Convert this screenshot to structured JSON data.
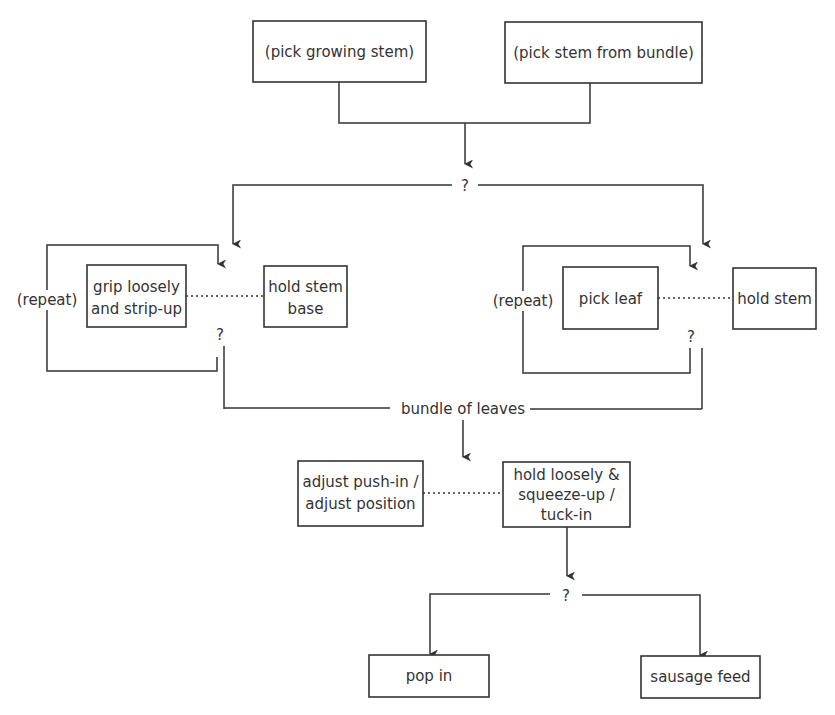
{
  "diagram": {
    "type": "flowchart",
    "start_nodes": [
      {
        "id": "pick-growing-stem",
        "label": "(pick growing stem)"
      },
      {
        "id": "pick-stem-from-bundle",
        "label": "(pick stem from bundle)"
      }
    ],
    "decision_top": {
      "label": "?"
    },
    "left_branch": {
      "repeat_label": "(repeat)",
      "action": {
        "lines": [
          "grip loosely",
          "and strip-up"
        ]
      },
      "support": {
        "lines": [
          "hold stem",
          "base"
        ]
      },
      "decision": {
        "label": "?"
      }
    },
    "right_branch": {
      "repeat_label": "(repeat)",
      "action": {
        "lines": [
          "pick leaf"
        ]
      },
      "support": {
        "lines": [
          "hold stem"
        ]
      },
      "decision": {
        "label": "?"
      }
    },
    "merge": {
      "label": "bundle of leaves"
    },
    "middle": {
      "support": {
        "lines": [
          "adjust push-in /",
          "adjust position"
        ]
      },
      "action": {
        "lines": [
          "hold loosely  &",
          "squeeze-up /",
          "tuck-in"
        ]
      }
    },
    "decision_bottom": {
      "label": "?"
    },
    "end_nodes": [
      {
        "id": "pop-in",
        "label": "pop in"
      },
      {
        "id": "sausage-feed",
        "label": "sausage feed"
      }
    ],
    "colors": {
      "stroke": "#333333",
      "background": "#ffffff"
    }
  }
}
